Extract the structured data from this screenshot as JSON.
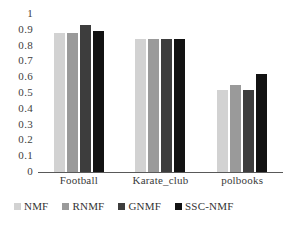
{
  "chart_data": {
    "type": "bar",
    "title": "",
    "subtitle": "",
    "xlabel": "",
    "ylabel": "",
    "categories": [
      "Football",
      "Karate_club",
      "polbooks"
    ],
    "series": [
      {
        "name": "NMF",
        "color": "#d2d2d2",
        "values": [
          0.88,
          0.84,
          0.52
        ]
      },
      {
        "name": "RNMF",
        "color": "#9a9a9a",
        "values": [
          0.88,
          0.84,
          0.55
        ]
      },
      {
        "name": "GNMF",
        "color": "#3d3d3d",
        "values": [
          0.93,
          0.84,
          0.52
        ]
      },
      {
        "name": "SSC-NMF",
        "color": "#121212",
        "values": [
          0.89,
          0.84,
          0.62
        ]
      }
    ],
    "ylim": [
      0,
      1
    ],
    "ytick_values": [
      0,
      0.1,
      0.2,
      0.3,
      0.4,
      0.5,
      0.6,
      0.7,
      0.8,
      0.9,
      1
    ],
    "ytick_labels": [
      "0",
      "0.1",
      "0.2",
      "0.3",
      "0.4",
      "0.5",
      "0.6",
      "0.7",
      "0.8",
      "0.9",
      "1"
    ],
    "grid": false,
    "legend_position": "bottom",
    "axis_line_color": "#595959"
  }
}
